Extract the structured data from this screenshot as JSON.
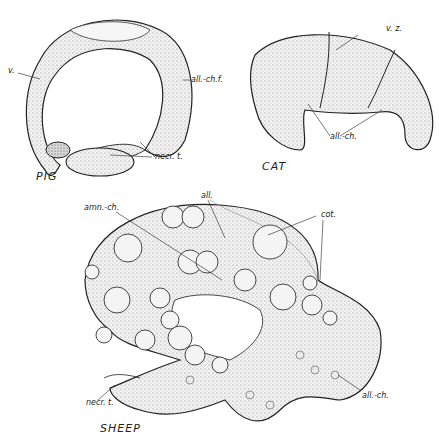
{
  "figures": [
    {
      "id": "pig",
      "title": "PIG",
      "labels": {
        "v": "v.",
        "all_ch_f": "all.-ch.f.",
        "necr_t": "necr. t."
      }
    },
    {
      "id": "cat",
      "title": "CAT",
      "labels": {
        "v_z": "v. z.",
        "all_ch": "all.-ch."
      }
    },
    {
      "id": "sheep",
      "title": "SHEEP",
      "labels": {
        "all": "all.",
        "amn_ch": "amn.-ch.",
        "cot": "cot.",
        "all_ch": "all.-ch.",
        "necr_t": "necr. t."
      }
    }
  ],
  "colors": {
    "ink": "#222222",
    "fill_light": "#e6e6e6",
    "fill_mid": "#cfcfcf",
    "fill_dark": "#b5b5b5"
  }
}
